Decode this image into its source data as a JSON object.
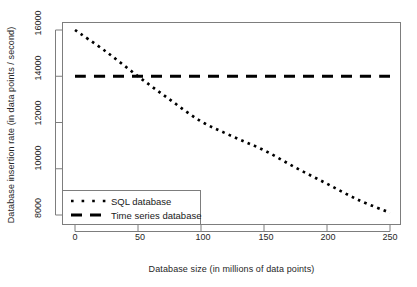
{
  "chart_data": {
    "type": "line",
    "title": "",
    "xlabel": "Database size (in millions of data points)",
    "ylabel": "Database insertion rate (in data points / second)",
    "xlim": [
      0,
      250
    ],
    "ylim": [
      8000,
      16000
    ],
    "xticks": [
      0,
      50,
      100,
      150,
      200,
      250
    ],
    "yticks": [
      8000,
      10000,
      12000,
      14000,
      16000
    ],
    "xtick_labels": [
      "0",
      "50",
      "100",
      "150",
      "200",
      "250"
    ],
    "ytick_labels": [
      "8000",
      "10000",
      "12000",
      "14000",
      "16000"
    ],
    "grid": false,
    "legend_position": "bottom-left",
    "x": [
      0,
      25,
      50,
      75,
      100,
      125,
      150,
      175,
      200,
      225,
      250
    ],
    "series": [
      {
        "name": "SQL database",
        "linestyle": "dotted",
        "color": "#000000",
        "values": [
          16000,
          15050,
          14000,
          13000,
          12050,
          11400,
          10800,
          10050,
          9350,
          8650,
          8100
        ]
      },
      {
        "name": "Time series database",
        "linestyle": "dashed",
        "color": "#000000",
        "values": [
          14000,
          14000,
          14000,
          14000,
          14000,
          14000,
          14000,
          14000,
          14000,
          14000,
          14000
        ]
      }
    ],
    "annotations": [
      {
        "text": "crossover near x = 50, y = 14000"
      }
    ]
  },
  "legend": {
    "items": [
      {
        "label": "SQL database",
        "style": "dotted"
      },
      {
        "label": "Time series database",
        "style": "dashed"
      }
    ]
  },
  "colors": {
    "plot_border": "#7d7d7d",
    "axis": "#7d7d7d",
    "line": "#000000",
    "background": "#ffffff",
    "text": "#262626"
  }
}
